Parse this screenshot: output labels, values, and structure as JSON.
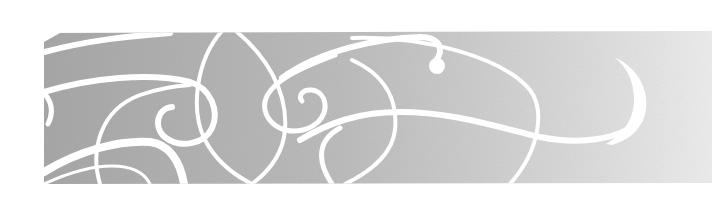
{
  "banner": {
    "kind": "decorative-swirl-banner",
    "colors": {
      "page_background": "#ffffff",
      "band_left": "#a8a8a8",
      "band_mid": "#c4c4c4",
      "band_right": "#ececec",
      "swirl": "#ffffff"
    },
    "band": {
      "x": 44,
      "y": 31,
      "width": 668,
      "height": 152
    },
    "ornaments": [
      {
        "name": "left-sweeping-stroke"
      },
      {
        "name": "left-spiral"
      },
      {
        "name": "center-lens-ellipse"
      },
      {
        "name": "center-spiral"
      },
      {
        "name": "upper-sweep-with-dot"
      },
      {
        "name": "long-horizontal-stroke"
      },
      {
        "name": "right-crescent-hook"
      }
    ]
  }
}
